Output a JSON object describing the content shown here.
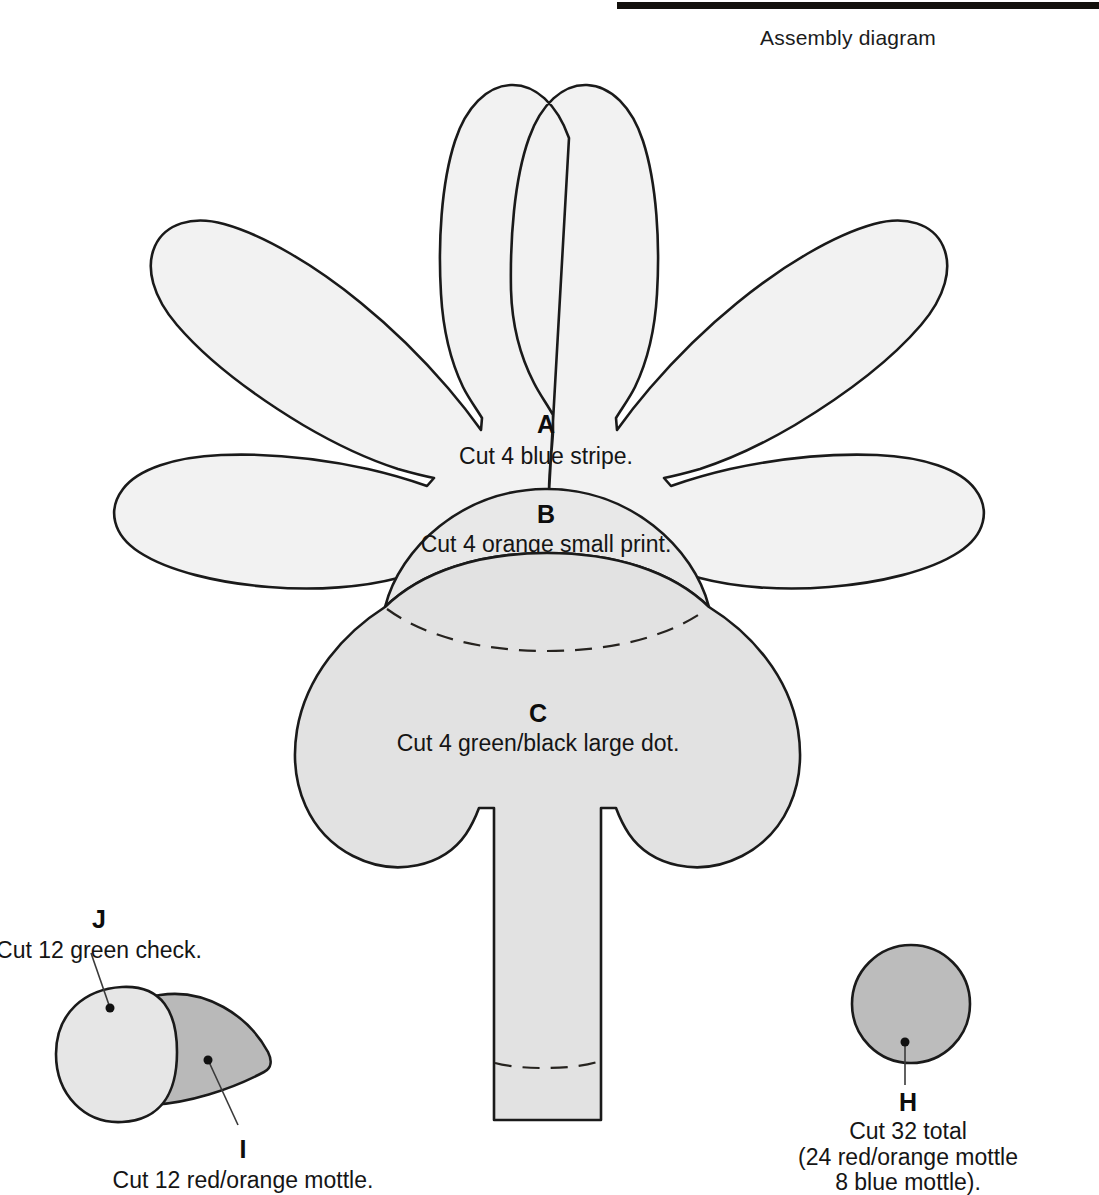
{
  "header": {
    "title": "Assembly diagram",
    "rule_color": "#12100c"
  },
  "colors": {
    "petal_fill": "#f2f2f2",
    "mid_fill": "#e8e8e8",
    "center_fill": "#e2e2e2",
    "dark_fill": "#b9b9b9",
    "outline": "#1a1a1a",
    "text": "#151515"
  },
  "pieces": {
    "A": {
      "letter": "A",
      "instruction": "Cut 4 blue stripe.",
      "fill": "#f2f2f2"
    },
    "B": {
      "letter": "B",
      "instruction": "Cut 4 orange small print.",
      "fill": "#e8e8e8"
    },
    "C": {
      "letter": "C",
      "instruction": "Cut 4 green/black large dot.",
      "fill": "#e2e2e2"
    },
    "J": {
      "letter": "J",
      "instruction": "Cut 12 green check.",
      "fill": "#e6e6e6"
    },
    "I": {
      "letter": "I",
      "instruction": "Cut 12 red/orange mottle.",
      "fill": "#b9b9b9"
    },
    "H": {
      "letter": "H",
      "instruction_line1": "Cut 32 total",
      "instruction_line2": "(24 red/orange mottle",
      "instruction_line3": "8 blue mottle).",
      "fill": "#bcbcbc"
    }
  }
}
